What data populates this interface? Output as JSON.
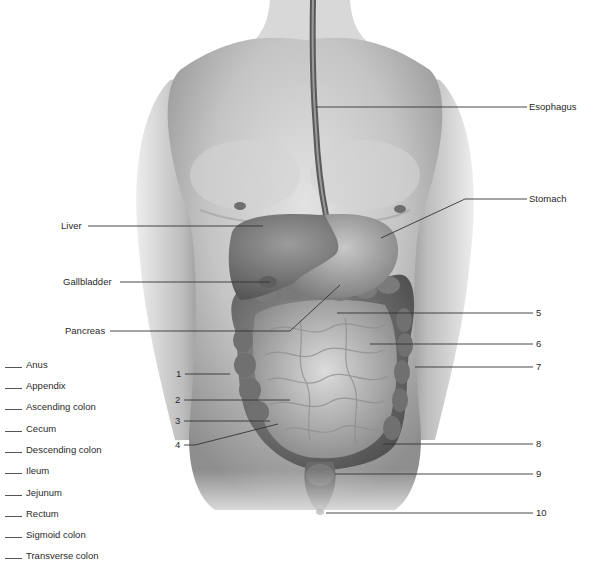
{
  "diagram": {
    "title_visible": "",
    "named_labels": [
      {
        "text": "Esophagus",
        "x": 529,
        "y": 102
      },
      {
        "text": "Stomach",
        "x": 529,
        "y": 193
      },
      {
        "text": "Liver",
        "x": 61,
        "y": 221
      },
      {
        "text": "Gallbladder",
        "x": 63,
        "y": 277
      },
      {
        "text": "Pancreas",
        "x": 65,
        "y": 326
      }
    ],
    "numbered_labels": [
      {
        "text": "1",
        "x": 176,
        "y": 369
      },
      {
        "text": "2",
        "x": 175,
        "y": 396
      },
      {
        "text": "3",
        "x": 175,
        "y": 416
      },
      {
        "text": "4",
        "x": 175,
        "y": 440
      },
      {
        "text": "5",
        "x": 536,
        "y": 305
      },
      {
        "text": "6",
        "x": 536,
        "y": 337
      },
      {
        "text": "7",
        "x": 536,
        "y": 361
      },
      {
        "text": "8",
        "x": 536,
        "y": 438
      },
      {
        "text": "9",
        "x": 536,
        "y": 467
      },
      {
        "text": "10",
        "x": 536,
        "y": 506
      }
    ],
    "answer_key": [
      {
        "blank": "____",
        "text": "Anus"
      },
      {
        "blank": "____",
        "text": "Appendix"
      },
      {
        "blank": "____",
        "text": "Ascending colon"
      },
      {
        "blank": "____",
        "text": "Cecum"
      },
      {
        "blank": "____",
        "text": "Descending colon"
      },
      {
        "blank": "____",
        "text": "Ileum"
      },
      {
        "blank": "____",
        "text": "Jejunum"
      },
      {
        "blank": "____",
        "text": "Rectum"
      },
      {
        "blank": "____",
        "text": "Sigmoid colon"
      },
      {
        "blank": "____",
        "text": "Transverse colon"
      }
    ],
    "colors": {
      "background": "#ffffff",
      "skin_mid": "#bdbdbd",
      "skin_dark": "#7a7a7a",
      "organ": "#8a8a8a",
      "leader_line": "#333333",
      "text": "#2a2a2a"
    }
  }
}
